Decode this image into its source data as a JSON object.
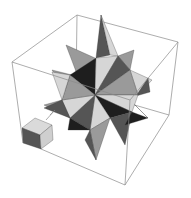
{
  "figure": {
    "width": 191,
    "height": 198,
    "background": "#ffffff",
    "colors": {
      "box_edge": "#8a8a8a",
      "light": "#d6d6d6",
      "mid": "#9a9a9a",
      "dark": "#555555",
      "black": "#1e1e1e"
    }
  }
}
